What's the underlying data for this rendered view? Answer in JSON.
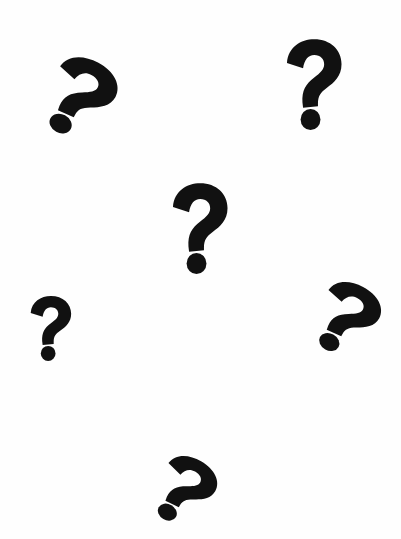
{
  "scene": {
    "background_color": "#ffffff",
    "mark_color": "#111111",
    "description": "Six black question marks scattered on a white background",
    "marks": [
      {
        "id": "upper-left",
        "glyph": "?",
        "left": 42,
        "top": 56,
        "width": 72,
        "height": 82,
        "rotate": 28
      },
      {
        "id": "upper-right",
        "glyph": "?",
        "left": 282,
        "top": 38,
        "width": 62,
        "height": 92,
        "rotate": 0
      },
      {
        "id": "center",
        "glyph": "?",
        "left": 168,
        "top": 182,
        "width": 62,
        "height": 92,
        "rotate": 0
      },
      {
        "id": "middle-left",
        "glyph": "?",
        "left": 27,
        "top": 295,
        "width": 46,
        "height": 66,
        "rotate": 0
      },
      {
        "id": "middle-right",
        "glyph": "?",
        "left": 312,
        "top": 281,
        "width": 66,
        "height": 74,
        "rotate": 28
      },
      {
        "id": "bottom",
        "glyph": "?",
        "left": 152,
        "top": 455,
        "width": 62,
        "height": 70,
        "rotate": 30
      }
    ]
  }
}
